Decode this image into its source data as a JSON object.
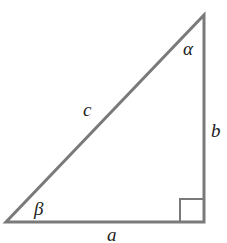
{
  "diagram": {
    "stroke_color": "#7a7a7a",
    "label_color": "#222222",
    "vertices": {
      "top": [
        204,
        15
      ],
      "bottom_left": [
        6,
        222
      ],
      "bottom_right": [
        204,
        222
      ]
    },
    "right_angle_marker": {
      "x": 180,
      "y": 199,
      "size": 24
    },
    "sides": {
      "a": "a",
      "b": "b",
      "c": "c"
    },
    "angles": {
      "alpha": "α",
      "beta": "β"
    }
  }
}
